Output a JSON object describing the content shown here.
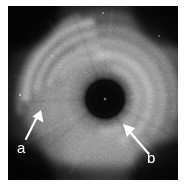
{
  "figure": {
    "kind": "intravascular-ultrasound-cross-section",
    "modality_label": "grayscale ultrasound",
    "background_color": "#ffffff",
    "frame": {
      "x": 8,
      "y": 6,
      "width": 170,
      "height": 174,
      "base_color": "#050505",
      "border_color": "#c8c8c8"
    }
  },
  "annotations": [
    {
      "id": "a",
      "label": "a",
      "label_color": "#ffffff",
      "label_x": 17,
      "label_y": 140,
      "arrow_color": "#ffffff",
      "arrow_tail_x": 26,
      "arrow_tail_y": 139,
      "arrow_tip_x": 41,
      "arrow_tip_y": 111
    },
    {
      "id": "b",
      "label": "b",
      "label_color": "#ffffff",
      "label_x": 147,
      "label_y": 150,
      "arrow_color": "#ffffff",
      "arrow_tail_x": 146,
      "arrow_tail_y": 151,
      "arrow_tip_x": 124,
      "arrow_tip_y": 126
    }
  ],
  "image_features": {
    "catheter_core": {
      "center_x": 105,
      "center_y": 99,
      "radius": 19,
      "color": "#0b0b0b"
    },
    "lumen_ring": {
      "center_x": 105,
      "center_y": 99,
      "inner_radius": 19,
      "outer_radius": 46
    },
    "vessel_wall_arcs": [
      {
        "radius": 36,
        "start_angle": 120,
        "end_angle": 255,
        "brightness": "#cfcfcf"
      },
      {
        "radius": 48,
        "start_angle": 105,
        "end_angle": 270,
        "brightness": "#dedede"
      },
      {
        "radius": 60,
        "start_angle": 95,
        "end_angle": 285,
        "brightness": "#bdbdbd"
      },
      {
        "radius": 72,
        "start_angle": 110,
        "end_angle": 250,
        "brightness": "#9a9a9a"
      },
      {
        "radius": 84,
        "start_angle": 125,
        "end_angle": 235,
        "brightness": "#6e6e6e"
      }
    ],
    "dark_corners": [
      "top-left",
      "top-right",
      "bottom-left",
      "bottom-right"
    ],
    "speckle": {
      "density": "high",
      "grain": "ultrasound-speckle"
    }
  }
}
